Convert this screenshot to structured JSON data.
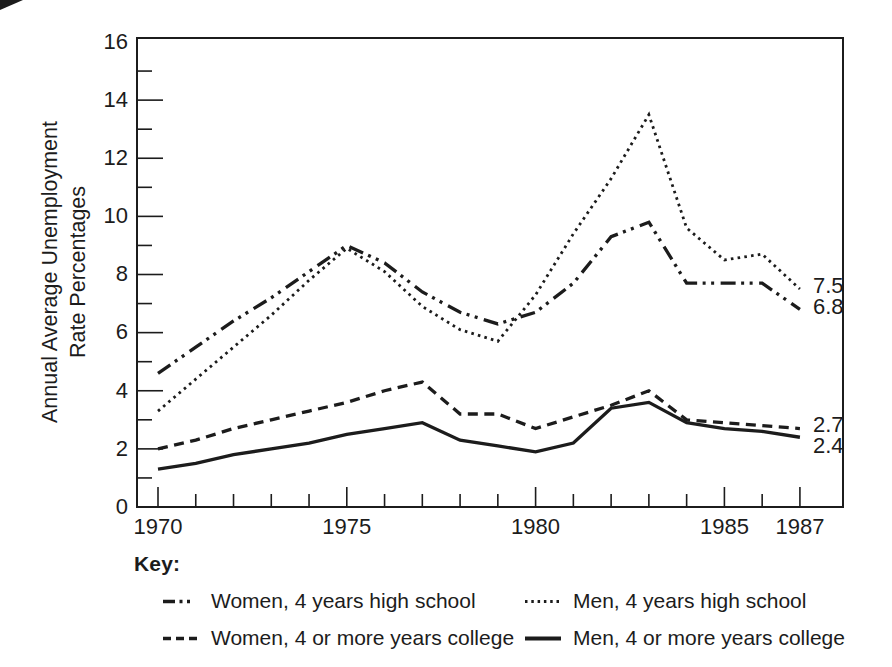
{
  "colors": {
    "ink": "#1c1c1c",
    "background": "#ffffff"
  },
  "key": {
    "title": "Key:",
    "entries": [
      {
        "label": "Women, 4 years high school",
        "style": "dash-dot-dot"
      },
      {
        "label": "Men, 4 years high school",
        "style": "dotted"
      },
      {
        "label": "Women, 4 or more years college",
        "style": "dashed"
      },
      {
        "label": "Men, 4 or more years college",
        "style": "solid"
      }
    ]
  },
  "chart_data": {
    "type": "line",
    "title": "",
    "ylabel": "Annual Average Unemployment Rate Percentages",
    "ylabel_lines": [
      "Annual Average Unemployment",
      "Rate Percentages"
    ],
    "xlabel": "",
    "x": [
      1970,
      1971,
      1972,
      1973,
      1974,
      1975,
      1976,
      1977,
      1978,
      1979,
      1980,
      1981,
      1982,
      1983,
      1984,
      1985,
      1986,
      1987
    ],
    "x_labeled_years": [
      1970,
      1975,
      1980,
      1985,
      1987
    ],
    "ylim": [
      0,
      16
    ],
    "y_tick_labels": [
      0,
      2,
      4,
      6,
      8,
      10,
      12,
      14,
      16
    ],
    "y_minor_tick_step": 1,
    "grid": "off",
    "legend_position": "below",
    "series": [
      {
        "id": "women-4yr-high-school",
        "name": "Women, 4 years high school",
        "style": "dash-dot-dot",
        "values": [
          4.6,
          5.5,
          6.4,
          7.2,
          8.1,
          9.0,
          8.4,
          7.4,
          6.7,
          6.3,
          6.7,
          7.7,
          9.3,
          9.8,
          7.7,
          7.7,
          7.7,
          6.8
        ],
        "end_label": "6.8"
      },
      {
        "id": "men-4yr-high-school",
        "name": "Men, 4 years high school",
        "style": "dotted",
        "values": [
          3.3,
          4.4,
          5.5,
          6.6,
          7.8,
          8.9,
          8.1,
          6.9,
          6.1,
          5.7,
          7.3,
          9.4,
          11.3,
          13.5,
          9.6,
          8.5,
          8.7,
          7.5
        ],
        "end_label": "7.5"
      },
      {
        "id": "women-4plus-college",
        "name": "Women, 4 or more years college",
        "style": "dashed",
        "values": [
          2.0,
          2.3,
          2.7,
          3.0,
          3.3,
          3.6,
          4.0,
          4.3,
          3.2,
          3.2,
          2.7,
          3.1,
          3.5,
          4.0,
          3.0,
          2.9,
          2.8,
          2.7
        ],
        "end_label": "2.7"
      },
      {
        "id": "men-4plus-college",
        "name": "Men, 4 or more years college",
        "style": "solid",
        "values": [
          1.3,
          1.5,
          1.8,
          2.0,
          2.2,
          2.5,
          2.7,
          2.9,
          2.3,
          2.1,
          1.9,
          2.2,
          3.4,
          3.6,
          2.9,
          2.7,
          2.6,
          2.4
        ],
        "end_label": "2.4"
      }
    ]
  }
}
